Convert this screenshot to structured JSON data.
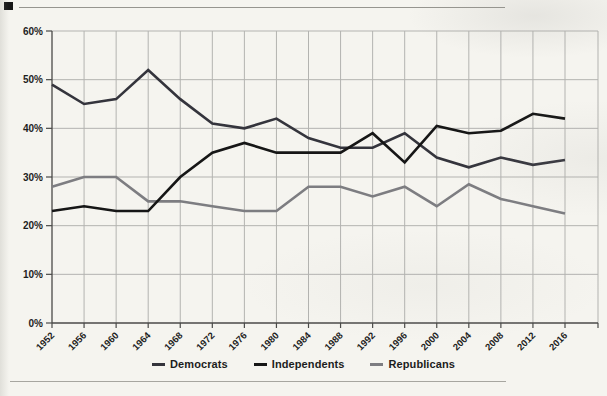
{
  "page": {
    "corner_marker": "black-square",
    "background_color": "#f5f4ef"
  },
  "chart_data": {
    "type": "line",
    "x": [
      1952,
      1956,
      1960,
      1964,
      1968,
      1972,
      1976,
      1980,
      1984,
      1988,
      1992,
      1996,
      2000,
      2004,
      2008,
      2012,
      2016
    ],
    "x_tick_labels": [
      "1952",
      "1956",
      "1960",
      "1964",
      "1968",
      "1972",
      "1976",
      "1980",
      "1984",
      "1988",
      "1992",
      "1996",
      "2000",
      "2004",
      "2008",
      "2012",
      "2016"
    ],
    "series": [
      {
        "name": "Democrats",
        "color": "#34343c",
        "values": [
          49,
          45,
          46,
          52,
          46,
          41,
          40,
          42,
          38,
          36,
          36,
          39,
          34,
          32,
          34,
          32.5,
          33.5
        ]
      },
      {
        "name": "Independents",
        "color": "#161616",
        "values": [
          23,
          24,
          23,
          23,
          30,
          35,
          37,
          35,
          35,
          35,
          39,
          33,
          40.5,
          39,
          39.5,
          43,
          42
        ]
      },
      {
        "name": "Republicans",
        "color": "#7d7d81",
        "values": [
          28,
          30,
          30,
          25,
          25,
          24,
          23,
          23,
          28,
          28,
          26,
          28,
          24,
          28.5,
          25.5,
          24,
          22.5
        ]
      }
    ],
    "ylim": [
      0,
      60
    ],
    "yticks": [
      0,
      10,
      20,
      30,
      40,
      50,
      60
    ],
    "ytick_labels": [
      "0%",
      "10%",
      "20%",
      "30%",
      "40%",
      "50%",
      "60%"
    ],
    "grid": true,
    "legend_position": "bottom",
    "colors": {
      "gridline": "#b3b3b0",
      "axis": "#4a4a48",
      "tick_label": "#1e1e1e"
    }
  }
}
